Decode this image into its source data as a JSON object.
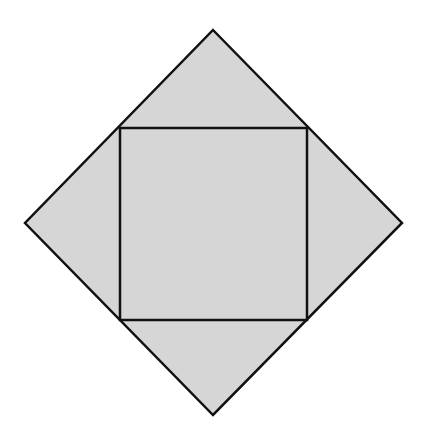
{
  "diagram": {
    "title_clipped": "",
    "colors": {
      "background": "#ffffff",
      "fill": "#d6d6d6",
      "stroke": "#111111"
    },
    "outer_diamond": {
      "points": "213,30 402,223 213,415 25,223",
      "stroke_width": 2.5
    },
    "inner_square": {
      "x": 120,
      "y": 128,
      "width": 187,
      "height": 192,
      "stroke_width": 2.5
    },
    "labels": []
  }
}
